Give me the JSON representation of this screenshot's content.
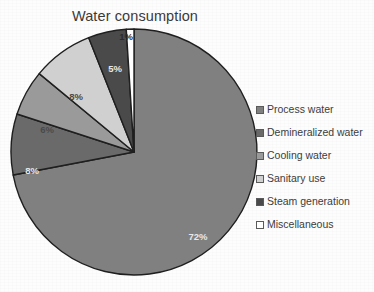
{
  "chart_data": {
    "type": "pie",
    "title": "Water consumption",
    "xlabel": "",
    "ylabel": "",
    "categories": [
      "Process water",
      "Demineralized water",
      "Cooling water",
      "Sanitary use",
      "Steam generation",
      "Miscellaneous"
    ],
    "values": [
      72,
      8,
      6,
      8,
      5,
      1
    ],
    "value_labels": [
      "72%",
      "8%",
      "6%",
      "8%",
      "5%",
      "1%"
    ],
    "colors": [
      "#808080",
      "#6a6a6a",
      "#9a9a9a",
      "#d0d0d0",
      "#4a4a4a",
      "#ffffff"
    ],
    "legend_position": "right",
    "grid": false,
    "start_angle_deg": 0,
    "direction": "clockwise",
    "units": "percent",
    "total": 100
  },
  "legend": {
    "items": [
      {
        "label": "Process water",
        "color": "#808080"
      },
      {
        "label": "Demineralized water",
        "color": "#6a6a6a"
      },
      {
        "label": "Cooling water",
        "color": "#9a9a9a"
      },
      {
        "label": "Sanitary use",
        "color": "#d0d0d0"
      },
      {
        "label": "Steam generation",
        "color": "#4a4a4a"
      },
      {
        "label": "Miscellaneous",
        "color": "#ffffff"
      }
    ]
  },
  "slice_labels": [
    {
      "text": "1%",
      "x": 118,
      "y": 14,
      "tone": "dark"
    },
    {
      "text": "5%",
      "x": 107,
      "y": 46,
      "tone": "light"
    },
    {
      "text": "8%",
      "x": 68,
      "y": 74,
      "tone": "mid"
    },
    {
      "text": "6%",
      "x": 39,
      "y": 107,
      "tone": "mid"
    },
    {
      "text": "8%",
      "x": 24,
      "y": 148,
      "tone": "light"
    },
    {
      "text": "72%",
      "x": 190,
      "y": 214,
      "tone": "light"
    }
  ],
  "geometry": {
    "cx": 126,
    "cy": 126,
    "r": 123,
    "stroke": "#1f1f1f",
    "stroke_width": 1.4
  }
}
